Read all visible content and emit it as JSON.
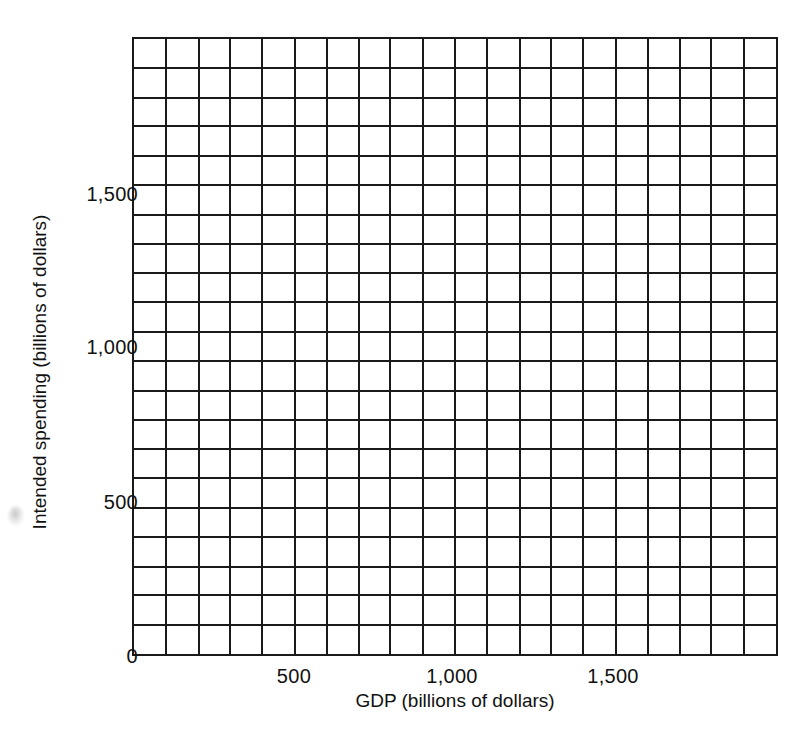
{
  "chart_data": {
    "type": "scatter",
    "title": "",
    "subtitle": "",
    "xlabel": "GDP (billions of dollars)",
    "ylabel": "Intended spending (billions of dollars)",
    "xlim": [
      0,
      2000
    ],
    "ylim": [
      0,
      2000
    ],
    "xticks": [
      {
        "value": 500,
        "label": "500"
      },
      {
        "value": 1000,
        "label": "1,000"
      },
      {
        "value": 1500,
        "label": "1,500"
      }
    ],
    "yticks": [
      {
        "value": 0,
        "label": "0"
      },
      {
        "value": 500,
        "label": "500"
      },
      {
        "value": 1000,
        "label": "1,000"
      },
      {
        "value": 1500,
        "label": "1,500"
      }
    ],
    "grid": true,
    "grid_columns": 20,
    "grid_rows": 21,
    "grid_color": "#1a1a1a",
    "series": [],
    "values": [],
    "x": [],
    "legend": [],
    "annotations": [],
    "note": "Empty graph-paper plotting grid; no data series are drawn."
  },
  "axes": {
    "x_title": "GDP (billions of dollars)",
    "y_title": "Intended spending (billions of dollars)",
    "x_tick_labels": [
      "500",
      "1,000",
      "1,500"
    ],
    "y_tick_labels": [
      "1,500",
      "1,000",
      "500",
      "0"
    ]
  },
  "colors": {
    "ink": "#1a1a1a",
    "text": "#111111",
    "paper": "#ffffff"
  }
}
